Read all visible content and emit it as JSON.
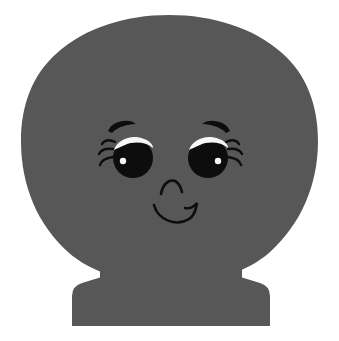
{
  "scene": {
    "title": "Cartoon Character Silhouette",
    "subject": "round-headed character on pedestal base",
    "background_color": "#ffffff",
    "width": 339,
    "height": 341
  },
  "palette": {
    "body_gray": "#575757",
    "ink_black": "#0d0d0d",
    "highlight_white": "#f7f7f7",
    "background": "#ffffff"
  },
  "body": {
    "head_label": "head",
    "head_shape": "rounded dome, slightly flattened top",
    "head_center_x": 169,
    "head_center_y": 152,
    "head_radius_x": 147,
    "head_radius_y": 137,
    "neck_label": "neck",
    "base_label": "pedestal base",
    "base_shape": "flared trapezoid pedestal",
    "base_top_y": 268,
    "base_bottom_y": 326,
    "base_bottom_left_x": 72,
    "base_bottom_right_x": 270
  },
  "face": {
    "left_eye": {
      "label": "left eye",
      "center_x": 133,
      "center_y": 158,
      "radius": 20,
      "pupil_color": "#0d0d0d",
      "highlight_color": "#f7f7f7",
      "glint_x": 123,
      "glint_y": 161,
      "glint_radius": 3,
      "lash_count": 3,
      "lash_side": "left"
    },
    "right_eye": {
      "label": "right eye",
      "center_x": 208,
      "center_y": 158,
      "radius": 20,
      "pupil_color": "#0d0d0d",
      "highlight_color": "#f7f7f7",
      "glint_x": 218,
      "glint_y": 161,
      "glint_radius": 3,
      "lash_count": 3,
      "lash_side": "right"
    },
    "left_eyebrow": {
      "label": "left eyebrow",
      "center_x": 122,
      "center_y": 127,
      "width": 28,
      "arc": "upward curve"
    },
    "right_eyebrow": {
      "label": "right eyebrow",
      "center_x": 213,
      "center_y": 127,
      "width": 28,
      "arc": "upward curve"
    },
    "nose": {
      "label": "nose",
      "shape": "caret arc",
      "center_x": 172,
      "center_y": 188,
      "width": 22
    },
    "mouth": {
      "label": "smiling mouth",
      "shape": "upward curve with right flick",
      "left_x": 154,
      "right_x": 197,
      "center_y": 213,
      "depth": 12
    }
  }
}
